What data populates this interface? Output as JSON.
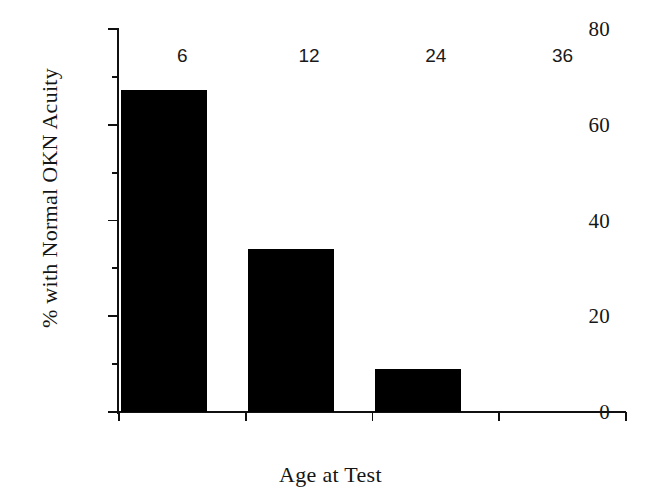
{
  "chart_data": {
    "type": "bar",
    "title": "",
    "subtitle": "",
    "categories": [
      "6",
      "12",
      "24",
      "36"
    ],
    "values": [
      67.2,
      34.0,
      9.0,
      0
    ],
    "xlabel": "Age at Test",
    "ylabel": "% with Normal OKN Acuity",
    "ylim": [
      0,
      80
    ],
    "y_major_ticks": [
      0,
      20,
      40,
      60,
      80
    ],
    "y_major_tick_labels": [
      "0",
      "20",
      "40",
      "60",
      "80"
    ],
    "y_minor_ticks": [
      10,
      30,
      50,
      70
    ],
    "grid": false,
    "legend": null,
    "bar_color": "#000000",
    "axis_color": "#101010",
    "background_color": "#ffffff",
    "annotations": []
  },
  "axes": {
    "y": {
      "title": "% with Normal OKN Acuity",
      "ticks": [
        {
          "value": 80,
          "label": "80",
          "kind": "major"
        },
        {
          "value": 70,
          "label": "",
          "kind": "minor"
        },
        {
          "value": 60,
          "label": "60",
          "kind": "major"
        },
        {
          "value": 50,
          "label": "",
          "kind": "minor"
        },
        {
          "value": 40,
          "label": "40",
          "kind": "major"
        },
        {
          "value": 30,
          "label": "",
          "kind": "minor"
        },
        {
          "value": 20,
          "label": "20",
          "kind": "major"
        },
        {
          "value": 10,
          "label": "",
          "kind": "minor"
        },
        {
          "value": 0,
          "label": "0",
          "kind": "major"
        }
      ]
    },
    "x": {
      "title": "Age at Test",
      "categories": [
        {
          "label": "6",
          "value": 67.2
        },
        {
          "label": "12",
          "value": 34.0
        },
        {
          "label": "24",
          "value": 9.0
        },
        {
          "label": "36",
          "value": 0
        }
      ]
    }
  }
}
